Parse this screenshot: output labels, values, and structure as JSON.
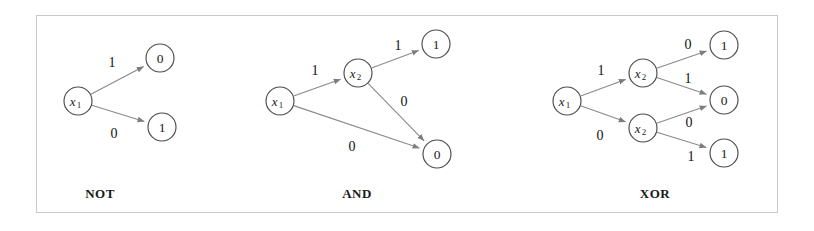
{
  "figure": {
    "background_color": "#ffffff",
    "border_color": "#c9c9c9",
    "node_stroke_color": "#4a4a4a",
    "edge_color": "#8a8a8a",
    "text_color": "#1a1a1a"
  },
  "diagrams": [
    {
      "caption": "NOT",
      "caption_x": 100,
      "caption_y": 193,
      "nodes": [
        {
          "name": "not-root-x1",
          "label": "x",
          "subscript": "1",
          "kind": "variable",
          "cx": 78,
          "cy": 101,
          "r": 14
        },
        {
          "name": "not-terminal-0",
          "label": "0",
          "subscript": "",
          "kind": "terminal",
          "cx": 160,
          "cy": 58,
          "r": 14
        },
        {
          "name": "not-terminal-1",
          "label": "1",
          "subscript": "",
          "kind": "terminal",
          "cx": 162,
          "cy": 127,
          "r": 14
        }
      ],
      "edges": [
        {
          "name": "not-edge-x1-to-0",
          "from": "not-root-x1",
          "to": "not-terminal-0",
          "label": "1",
          "label_x": 112,
          "label_y": 62
        },
        {
          "name": "not-edge-x1-to-1",
          "from": "not-root-x1",
          "to": "not-terminal-1",
          "label": "0",
          "label_x": 114,
          "label_y": 133
        }
      ]
    },
    {
      "caption": "AND",
      "caption_x": 357,
      "caption_y": 193,
      "nodes": [
        {
          "name": "and-root-x1",
          "label": "x",
          "subscript": "1",
          "kind": "variable",
          "cx": 280,
          "cy": 101,
          "r": 14
        },
        {
          "name": "and-node-x2",
          "label": "x",
          "subscript": "2",
          "kind": "variable",
          "cx": 358,
          "cy": 73,
          "r": 14
        },
        {
          "name": "and-terminal-1",
          "label": "1",
          "subscript": "",
          "kind": "terminal",
          "cx": 436,
          "cy": 44,
          "r": 14
        },
        {
          "name": "and-terminal-0",
          "label": "0",
          "subscript": "",
          "kind": "terminal",
          "cx": 437,
          "cy": 154,
          "r": 14
        }
      ],
      "edges": [
        {
          "name": "and-edge-x1-to-x2",
          "from": "and-root-x1",
          "to": "and-node-x2",
          "label": "1",
          "label_x": 315,
          "label_y": 70
        },
        {
          "name": "and-edge-x1-to-0",
          "from": "and-root-x1",
          "to": "and-terminal-0",
          "label": "0",
          "label_x": 352,
          "label_y": 146
        },
        {
          "name": "and-edge-x2-to-1",
          "from": "and-node-x2",
          "to": "and-terminal-1",
          "label": "1",
          "label_x": 398,
          "label_y": 45
        },
        {
          "name": "and-edge-x2-to-0",
          "from": "and-node-x2",
          "to": "and-terminal-0",
          "label": "0",
          "label_x": 404,
          "label_y": 101
        }
      ]
    },
    {
      "caption": "XOR",
      "caption_x": 655,
      "caption_y": 193,
      "nodes": [
        {
          "name": "xor-root-x1",
          "label": "x",
          "subscript": "1",
          "kind": "variable",
          "cx": 567,
          "cy": 101,
          "r": 14
        },
        {
          "name": "xor-node-x2-upper",
          "label": "x",
          "subscript": "2",
          "kind": "variable",
          "cx": 643,
          "cy": 73,
          "r": 14
        },
        {
          "name": "xor-node-x2-lower",
          "label": "x",
          "subscript": "2",
          "kind": "variable",
          "cx": 643,
          "cy": 128,
          "r": 14
        },
        {
          "name": "xor-terminal-1-top",
          "label": "1",
          "subscript": "",
          "kind": "terminal",
          "cx": 724,
          "cy": 45,
          "r": 14
        },
        {
          "name": "xor-terminal-0",
          "label": "0",
          "subscript": "",
          "kind": "terminal",
          "cx": 724,
          "cy": 100,
          "r": 14
        },
        {
          "name": "xor-terminal-1-bot",
          "label": "1",
          "subscript": "",
          "kind": "terminal",
          "cx": 724,
          "cy": 153,
          "r": 14
        }
      ],
      "edges": [
        {
          "name": "xor-edge-x1-to-x2-upper",
          "from": "xor-root-x1",
          "to": "xor-node-x2-upper",
          "label": "1",
          "label_x": 601,
          "label_y": 70
        },
        {
          "name": "xor-edge-x1-to-x2-lower",
          "from": "xor-root-x1",
          "to": "xor-node-x2-lower",
          "label": "0",
          "label_x": 600,
          "label_y": 135
        },
        {
          "name": "xor-edge-x2u-to-1",
          "from": "xor-node-x2-upper",
          "to": "xor-terminal-1-top",
          "label": "0",
          "label_x": 688,
          "label_y": 44
        },
        {
          "name": "xor-edge-x2u-to-0",
          "from": "xor-node-x2-upper",
          "to": "xor-terminal-0",
          "label": "1",
          "label_x": 688,
          "label_y": 78
        },
        {
          "name": "xor-edge-x2l-to-0",
          "from": "xor-node-x2-lower",
          "to": "xor-terminal-0",
          "label": "0",
          "label_x": 689,
          "label_y": 122
        },
        {
          "name": "xor-edge-x2l-to-1",
          "from": "xor-node-x2-lower",
          "to": "xor-terminal-1-bot",
          "label": "1",
          "label_x": 691,
          "label_y": 156
        }
      ]
    }
  ]
}
